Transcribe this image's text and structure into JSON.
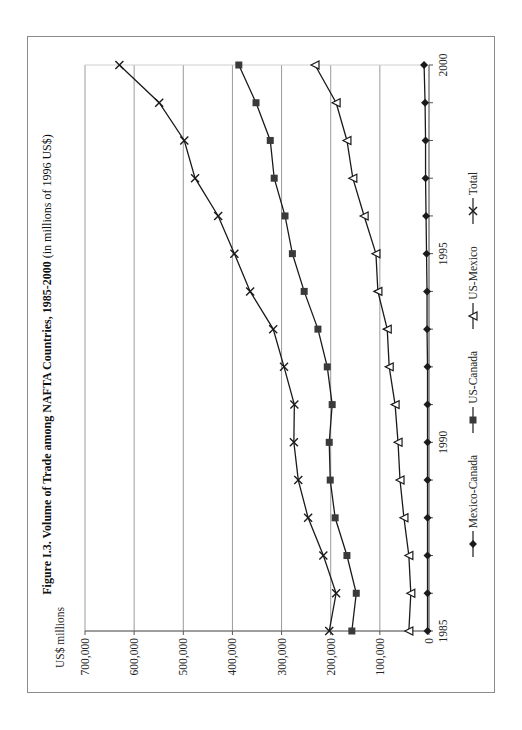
{
  "figure": {
    "title_bold": "Figure I.3. Volume of Trade among NAFTA Countries, 1985-2000",
    "title_normal": " (in millions of 1996 US$)",
    "y_axis_label": "US$ millions"
  },
  "legend": [
    {
      "name": "Mexico-Canada",
      "marker": "diamond"
    },
    {
      "name": "US-Canada",
      "marker": "square"
    },
    {
      "name": "US-Mexico",
      "marker": "triangle-open"
    },
    {
      "name": "Total",
      "marker": "x-cross"
    }
  ],
  "colors": {
    "line": "#1a1a1a",
    "square_fill": "#3a3a3a",
    "grid": "#9a9a9a",
    "frame": "#8a8a8a",
    "background": "#ffffff"
  },
  "chart_data": {
    "type": "line",
    "title": "Figure I.3. Volume of Trade among NAFTA Countries, 1985-2000 (in millions of 1996 US$)",
    "xlabel": "",
    "ylabel": "US$ millions",
    "orientation_note": "figure rotated 90 degrees counterclockwise on page",
    "x": [
      1985,
      1986,
      1987,
      1988,
      1989,
      1990,
      1991,
      1992,
      1993,
      1994,
      1995,
      1996,
      1997,
      1998,
      1999,
      2000
    ],
    "x_tick_labels": [
      "1985",
      "1990",
      "1995",
      "2000"
    ],
    "ylim": [
      0,
      700000
    ],
    "y_tick_labels": [
      "0",
      "100,000",
      "200,000",
      "300,000",
      "400,000",
      "500,000",
      "600,000",
      "700,000"
    ],
    "y_ticks": [
      0,
      100000,
      200000,
      300000,
      400000,
      500000,
      600000,
      700000
    ],
    "grid": "horizontal major gridlines",
    "legend_position": "bottom",
    "series": [
      {
        "name": "Mexico-Canada",
        "marker": "diamond",
        "values": [
          3000,
          3000,
          3000,
          3000,
          3000,
          3000,
          3000,
          3000,
          4000,
          4000,
          5000,
          6000,
          7000,
          7000,
          8000,
          10000
        ]
      },
      {
        "name": "US-Canada",
        "marker": "square",
        "values": [
          157000,
          148000,
          167000,
          191000,
          201000,
          203000,
          197000,
          207000,
          226000,
          254000,
          278000,
          293000,
          315000,
          323000,
          352000,
          387000
        ]
      },
      {
        "name": "US-Mexico",
        "marker": "triangle-open",
        "values": [
          41000,
          37000,
          41000,
          51000,
          59000,
          63000,
          69000,
          81000,
          85000,
          104000,
          108000,
          132000,
          155000,
          167000,
          189000,
          232000
        ]
      },
      {
        "name": "Total",
        "marker": "x-cross",
        "values": [
          203000,
          189000,
          215000,
          246000,
          266000,
          275000,
          274000,
          295000,
          317000,
          364000,
          396000,
          429000,
          476000,
          498000,
          549000,
          630000
        ]
      }
    ]
  }
}
